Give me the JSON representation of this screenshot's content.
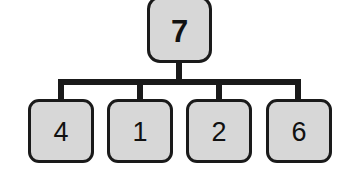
{
  "diagram": {
    "type": "tree",
    "title": "",
    "background_color": "#ffffff",
    "node_fill_color": "#d7d7d7",
    "node_border_color": "#1a1a1a",
    "edge_color": "#1a1a1a",
    "text_color": "#111111",
    "root": {
      "label": "7",
      "bold": true
    },
    "children": [
      {
        "label": "4",
        "bold": false
      },
      {
        "label": "1",
        "bold": false
      },
      {
        "label": "2",
        "bold": false
      },
      {
        "label": "6",
        "bold": false
      }
    ]
  }
}
